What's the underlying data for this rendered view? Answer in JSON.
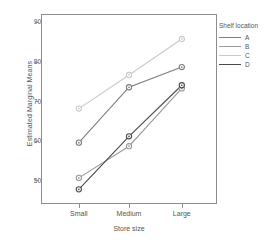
{
  "chart_data": {
    "type": "line",
    "title": "",
    "xlabel": "Store size",
    "ylabel": "Estimated Marginal Means",
    "categories": [
      "Small",
      "Medium",
      "Large"
    ],
    "ylim": [
      44,
      92
    ],
    "yticks": [
      50,
      60,
      70,
      80,
      90
    ],
    "ytick_labels": [
      "50",
      "60",
      "70",
      "80",
      "90"
    ],
    "grid": false,
    "legend_position": "right",
    "legend_title": "Shelf location",
    "series": [
      {
        "name": "A",
        "values": [
          59.5,
          73.5,
          78.6
        ],
        "color": "#7c7c7c"
      },
      {
        "name": "B",
        "values": [
          50.6,
          58.6,
          73.2
        ],
        "color": "#9a9a9a"
      },
      {
        "name": "C",
        "values": [
          68.1,
          76.6,
          85.7
        ],
        "color": "#c9c9c9"
      },
      {
        "name": "D",
        "values": [
          47.7,
          61.1,
          74.0
        ],
        "color": "#4a4a4a"
      }
    ]
  },
  "axes": {
    "y_title": "Estimated Marginal Means",
    "x_title": "Store size",
    "y_tick_labels": [
      "90",
      "80",
      "70",
      "60",
      "50"
    ],
    "x_tick_labels": [
      "Small",
      "Medium",
      "Large"
    ]
  },
  "legend": {
    "title": "Shelf location",
    "items": [
      {
        "label": "A",
        "color": "#7c7c7c"
      },
      {
        "label": "B",
        "color": "#9a9a9a"
      },
      {
        "label": "C",
        "color": "#c9c9c9"
      },
      {
        "label": "D",
        "color": "#4a4a4a"
      }
    ]
  },
  "colors": {
    "axis": "#8d8d8d",
    "text": "#555555",
    "background": "#ffffff"
  }
}
